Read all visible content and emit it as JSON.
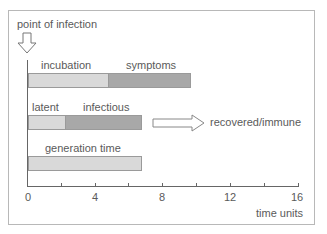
{
  "diagram": {
    "title_label": "point of infection",
    "rows": [
      {
        "segments": [
          {
            "label": "incubation",
            "start": 0,
            "end": 4.8,
            "shade": "light"
          },
          {
            "label": "symptoms",
            "start": 4.8,
            "end": 9.7,
            "shade": "dark"
          }
        ]
      },
      {
        "segments": [
          {
            "label": "latent",
            "start": 0,
            "end": 2.2,
            "shade": "light"
          },
          {
            "label": "infectious",
            "start": 2.2,
            "end": 6.8,
            "shade": "dark"
          }
        ],
        "outcome_label": "recovered/immune"
      },
      {
        "segments": [
          {
            "label": "generation time",
            "start": 0,
            "end": 6.8,
            "shade": "light"
          }
        ]
      }
    ],
    "axis": {
      "ticks": [
        "0",
        "4",
        "8",
        "12",
        "16"
      ],
      "minor_ticks": [
        2,
        6,
        10,
        14
      ],
      "xlabel": "time units",
      "range": [
        0,
        16
      ]
    },
    "colors": {
      "light_fill": "#d9d9d9",
      "dark_fill": "#a8a8a8",
      "border": "#9a9a9a",
      "frame": "#b8b8b8"
    }
  }
}
